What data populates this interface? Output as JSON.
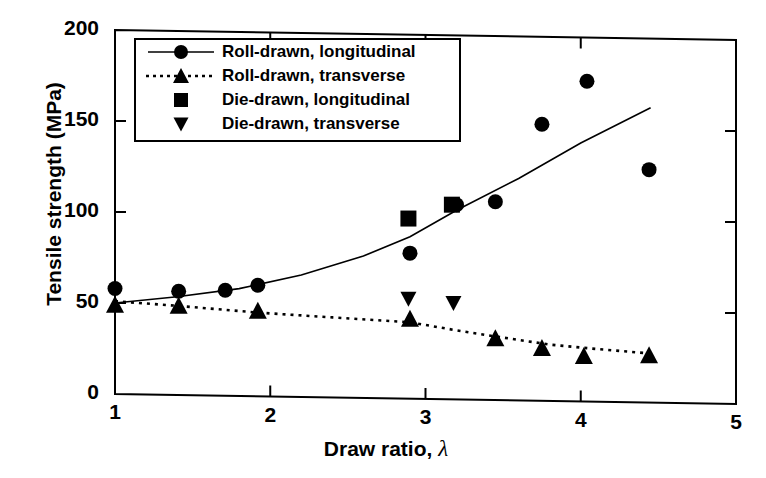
{
  "chart_data": {
    "type": "scatter",
    "title": "",
    "xlabel": "Draw ratio,  λ",
    "ylabel": "Tensile strength (MPa)",
    "xlim": [
      1,
      5
    ],
    "ylim": [
      0,
      200
    ],
    "xticks": [
      1,
      2,
      3,
      4,
      5
    ],
    "yticks": [
      0,
      50,
      100,
      150,
      200
    ],
    "xtick_labels": [
      "1",
      "2",
      "3",
      "4",
      "5"
    ],
    "ytick_labels": [
      "0",
      "50",
      "100",
      "150",
      "200"
    ],
    "grid": false,
    "legend_position": "upper-left-inside",
    "series": [
      {
        "name": "Roll-drawn, longitudinal",
        "marker": "circle",
        "line": "solid",
        "color": "#000000",
        "points": [
          {
            "x": 1.0,
            "y": 58
          },
          {
            "x": 1.41,
            "y": 57
          },
          {
            "x": 1.71,
            "y": 58
          },
          {
            "x": 1.92,
            "y": 61
          },
          {
            "x": 2.9,
            "y": 80
          },
          {
            "x": 3.2,
            "y": 107
          },
          {
            "x": 3.45,
            "y": 109
          },
          {
            "x": 3.75,
            "y": 152
          },
          {
            "x": 4.04,
            "y": 176
          },
          {
            "x": 4.44,
            "y": 128
          }
        ],
        "fit_line": [
          {
            "x": 1.0,
            "y": 50
          },
          {
            "x": 1.4,
            "y": 54
          },
          {
            "x": 1.8,
            "y": 59
          },
          {
            "x": 2.2,
            "y": 67
          },
          {
            "x": 2.6,
            "y": 78
          },
          {
            "x": 2.9,
            "y": 89
          },
          {
            "x": 3.2,
            "y": 104
          },
          {
            "x": 3.6,
            "y": 122
          },
          {
            "x": 4.0,
            "y": 142
          },
          {
            "x": 4.45,
            "y": 162
          }
        ]
      },
      {
        "name": "Roll-drawn, transverse",
        "marker": "triangle-up",
        "line": "dotted",
        "color": "#000000",
        "points": [
          {
            "x": 1.0,
            "y": 49
          },
          {
            "x": 1.41,
            "y": 49
          },
          {
            "x": 1.92,
            "y": 47
          },
          {
            "x": 2.9,
            "y": 44
          },
          {
            "x": 3.45,
            "y": 34
          },
          {
            "x": 3.75,
            "y": 29
          },
          {
            "x": 4.02,
            "y": 25
          },
          {
            "x": 4.44,
            "y": 26
          }
        ],
        "fit_line": [
          {
            "x": 1.0,
            "y": 51
          },
          {
            "x": 1.4,
            "y": 49
          },
          {
            "x": 1.92,
            "y": 46
          },
          {
            "x": 2.4,
            "y": 44
          },
          {
            "x": 2.9,
            "y": 42
          },
          {
            "x": 3.2,
            "y": 38
          },
          {
            "x": 3.45,
            "y": 35
          },
          {
            "x": 3.8,
            "y": 31
          },
          {
            "x": 4.1,
            "y": 29
          },
          {
            "x": 4.45,
            "y": 27
          }
        ]
      },
      {
        "name": "Die-drawn, longitudinal",
        "marker": "square",
        "line": "none",
        "color": "#000000",
        "points": [
          {
            "x": 2.89,
            "y": 99
          },
          {
            "x": 3.17,
            "y": 107
          }
        ]
      },
      {
        "name": "Die-drawn, transverse",
        "marker": "triangle-down",
        "line": "none",
        "color": "#000000",
        "points": [
          {
            "x": 2.89,
            "y": 55
          },
          {
            "x": 3.18,
            "y": 53
          }
        ]
      }
    ]
  },
  "legend": {
    "items": [
      {
        "label": "Roll-drawn, longitudinal",
        "marker": "circle",
        "line": "solid"
      },
      {
        "label": "Roll-drawn, transverse",
        "marker": "triangle-up",
        "line": "dotted"
      },
      {
        "label": "Die-drawn, longitudinal",
        "marker": "square",
        "line": "none"
      },
      {
        "label": "Die-drawn, transverse",
        "marker": "triangle-down",
        "line": "none"
      }
    ]
  },
  "axis": {
    "y_label": "Tensile strength (MPa)",
    "x_label_text": "Draw ratio, ",
    "x_label_symbol": "λ"
  }
}
